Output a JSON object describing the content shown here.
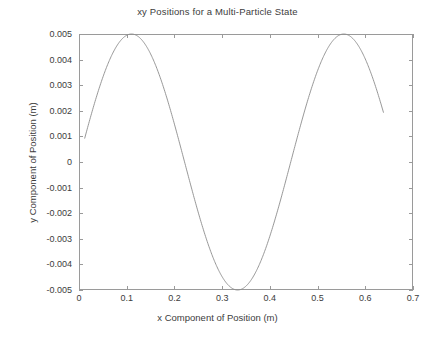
{
  "chart_data": {
    "type": "line",
    "title": "xy Positions for a Multi-Particle State",
    "xlabel": "x Component of Position (m)",
    "ylabel": "y Component of Position (m)",
    "xlim": [
      0,
      0.7
    ],
    "ylim": [
      -0.005,
      0.005
    ],
    "xticks": [
      0,
      0.1,
      0.2,
      0.3,
      0.4,
      0.5,
      0.6,
      0.7
    ],
    "xtick_labels": [
      "0",
      "0.1",
      "0.2",
      "0.3",
      "0.4",
      "0.5",
      "0.6",
      "0.7"
    ],
    "yticks": [
      0.005,
      0.004,
      0.003,
      0.002,
      0.001,
      0,
      -0.001,
      -0.002,
      -0.003,
      -0.004,
      -0.005
    ],
    "ytick_labels": [
      "0.005",
      "0.004",
      "0.003",
      "0.002",
      "0.001",
      "0",
      "-0.001",
      "-0.002",
      "-0.003",
      "-0.004",
      "-0.005"
    ],
    "grid": false,
    "legend": false,
    "line_color": "#8c8c8c",
    "line_width": 0.9,
    "axis_color": "#9a9a9a",
    "background": "#ffffff",
    "series": [
      {
        "name": "xy position",
        "amplitude": 0.005,
        "period": 0.445,
        "peak_x": [
          0.11,
          0.555
        ],
        "trough_x": [
          0.3325
        ],
        "x_start": 0.012,
        "x_end": 0.638,
        "x": [
          0.012,
          0.022,
          0.032,
          0.042,
          0.052,
          0.062,
          0.072,
          0.082,
          0.092,
          0.102,
          0.11,
          0.122,
          0.132,
          0.142,
          0.152,
          0.162,
          0.172,
          0.182,
          0.192,
          0.202,
          0.212,
          0.222,
          0.232,
          0.242,
          0.252,
          0.262,
          0.272,
          0.282,
          0.292,
          0.302,
          0.312,
          0.322,
          0.3325,
          0.342,
          0.352,
          0.362,
          0.372,
          0.382,
          0.392,
          0.402,
          0.412,
          0.422,
          0.432,
          0.442,
          0.452,
          0.462,
          0.472,
          0.482,
          0.492,
          0.502,
          0.512,
          0.522,
          0.532,
          0.542,
          0.555,
          0.562,
          0.572,
          0.582,
          0.592,
          0.602,
          0.612,
          0.622,
          0.632,
          0.638
        ],
        "y": [
          0.00078,
          0.00147,
          0.00215,
          0.00281,
          0.00344,
          0.00403,
          0.00456,
          0.00503,
          0.00542,
          0.00573,
          0.005,
          0.00496,
          0.00486,
          0.00469,
          0.00446,
          0.00416,
          0.00381,
          0.0034,
          0.00295,
          0.00246,
          0.00194,
          0.0014,
          0.00084,
          0.00028,
          -0.00029,
          -0.00085,
          -0.0014,
          -0.00192,
          -0.00242,
          -0.00288,
          -0.0033,
          -0.00368,
          -0.005,
          -0.00485,
          -0.00468,
          -0.00445,
          -0.00417,
          -0.00383,
          -0.00344,
          -0.00301,
          -0.00253,
          -0.00202,
          -0.00149,
          -0.00094,
          -0.00038,
          0.00019,
          0.00076,
          0.00131,
          0.00185,
          0.00237,
          0.00286,
          0.00331,
          0.00373,
          0.00409,
          0.005,
          0.00492,
          0.00473,
          0.00447,
          0.00415,
          0.00377,
          0.00333,
          0.00285,
          0.00232,
          0.00198
        ]
      }
    ]
  },
  "plot_box": {
    "left": 79,
    "right": 413,
    "top": 34,
    "bottom": 290
  }
}
